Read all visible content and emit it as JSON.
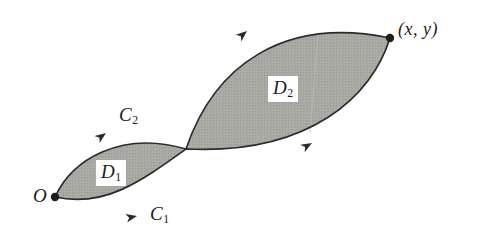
{
  "figure": {
    "background_color": "#ffffff",
    "fill_color": "#a8a8a2",
    "stroke_color": "#2b2b2b",
    "width": 482,
    "height": 239
  },
  "labels": {
    "region_1": {
      "base": "D",
      "sub": "1"
    },
    "region_2": {
      "base": "D",
      "sub": "2"
    },
    "curve_1": {
      "base": "C",
      "sub": "1"
    },
    "curve_2": {
      "base": "C",
      "sub": "2"
    },
    "origin": "O",
    "endpoint": "(x,  y)"
  },
  "points": {
    "origin": {
      "x": 55,
      "y": 197
    },
    "crossing": {
      "x": 186,
      "y": 149
    },
    "endpoint": {
      "x": 390,
      "y": 38
    }
  },
  "arrows": [
    {
      "name": "arrow-on-curve-C2-lower-loop",
      "x": 106,
      "y": 133,
      "angle": -36
    },
    {
      "name": "arrow-on-curve-C1-lower-loop",
      "x": 137,
      "y": 216,
      "angle": -12
    },
    {
      "name": "arrow-on-curve-C2-upper-loop",
      "x": 247,
      "y": 31,
      "angle": -40
    },
    {
      "name": "arrow-on-curve-C1-upper-loop",
      "x": 312,
      "y": 143,
      "angle": -30
    }
  ]
}
